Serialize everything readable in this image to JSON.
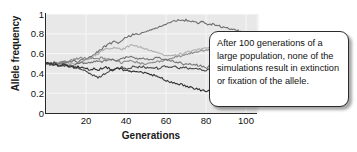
{
  "chart_data": {
    "type": "line",
    "title": "",
    "xlabel": "Generations",
    "ylabel": "Allele frequency",
    "xlim": [
      0,
      105
    ],
    "ylim": [
      0,
      1
    ],
    "grid": true,
    "legend": "none",
    "xticks": [
      "20",
      "40",
      "60",
      "80",
      "100"
    ],
    "xtick_values": [
      20,
      40,
      60,
      80,
      100
    ],
    "yticks": [
      "0",
      "0.2",
      "0.4",
      "0.6",
      "0.8",
      "1"
    ],
    "ytick_values": [
      0,
      0.2,
      0.4,
      0.6,
      0.8,
      1
    ],
    "annotation": "After 100 generations of a large population, none of the simulations result in extinction or fixation of the allele.",
    "start_frequency": 0.5,
    "series": [
      {
        "name": "simulation-1",
        "color": "#6e6e6e",
        "x": [
          0,
          2,
          4,
          6,
          8,
          10,
          12,
          14,
          16,
          18,
          20,
          22,
          24,
          26,
          28,
          30,
          32,
          34,
          36,
          38,
          40,
          42,
          44,
          46,
          48,
          50,
          52,
          54,
          56,
          58,
          60,
          62,
          64,
          66,
          68,
          70,
          72,
          74,
          76,
          78,
          80,
          82,
          84,
          86,
          88,
          90,
          92,
          94,
          96,
          98,
          100
        ],
        "values": [
          0.5,
          0.5,
          0.51,
          0.5,
          0.52,
          0.51,
          0.52,
          0.53,
          0.52,
          0.54,
          0.55,
          0.57,
          0.59,
          0.62,
          0.65,
          0.68,
          0.7,
          0.72,
          0.71,
          0.74,
          0.77,
          0.78,
          0.8,
          0.79,
          0.81,
          0.82,
          0.84,
          0.85,
          0.87,
          0.88,
          0.9,
          0.92,
          0.93,
          0.94,
          0.93,
          0.94,
          0.92,
          0.93,
          0.91,
          0.92,
          0.9,
          0.89,
          0.9,
          0.88,
          0.87,
          0.86,
          0.85,
          0.84,
          0.83,
          0.82,
          0.82
        ]
      },
      {
        "name": "simulation-2",
        "color": "#b0b0b0",
        "x": [
          0,
          2,
          4,
          6,
          8,
          10,
          12,
          14,
          16,
          18,
          20,
          22,
          24,
          26,
          28,
          30,
          32,
          34,
          36,
          38,
          40,
          42,
          44,
          46,
          48,
          50,
          52,
          54,
          56,
          58,
          60,
          62,
          64,
          66,
          68,
          70,
          72,
          74,
          76,
          78,
          80,
          82,
          84,
          86,
          88,
          90,
          92,
          94,
          96,
          98,
          100
        ],
        "values": [
          0.5,
          0.49,
          0.5,
          0.49,
          0.48,
          0.49,
          0.5,
          0.49,
          0.5,
          0.52,
          0.53,
          0.55,
          0.58,
          0.6,
          0.63,
          0.65,
          0.64,
          0.66,
          0.65,
          0.64,
          0.66,
          0.68,
          0.69,
          0.67,
          0.66,
          0.65,
          0.63,
          0.62,
          0.6,
          0.59,
          0.58,
          0.57,
          0.58,
          0.59,
          0.6,
          0.61,
          0.62,
          0.63,
          0.64,
          0.65,
          0.66,
          0.65,
          0.66,
          0.67,
          0.68,
          0.69,
          0.7,
          0.69,
          0.68,
          0.67,
          0.66
        ]
      },
      {
        "name": "simulation-3",
        "color": "#8a8a8a",
        "x": [
          0,
          2,
          4,
          6,
          8,
          10,
          12,
          14,
          16,
          18,
          20,
          22,
          24,
          26,
          28,
          30,
          32,
          34,
          36,
          38,
          40,
          42,
          44,
          46,
          48,
          50,
          52,
          54,
          56,
          58,
          60,
          62,
          64,
          66,
          68,
          70,
          72,
          74,
          76,
          78,
          80,
          82,
          84,
          86,
          88,
          90,
          92,
          94,
          96,
          98,
          100
        ],
        "values": [
          0.5,
          0.5,
          0.49,
          0.5,
          0.51,
          0.52,
          0.53,
          0.54,
          0.55,
          0.56,
          0.55,
          0.56,
          0.55,
          0.54,
          0.56,
          0.55,
          0.54,
          0.53,
          0.52,
          0.51,
          0.52,
          0.53,
          0.52,
          0.51,
          0.5,
          0.49,
          0.5,
          0.51,
          0.52,
          0.53,
          0.54,
          0.55,
          0.56,
          0.57,
          0.58,
          0.59,
          0.6,
          0.61,
          0.62,
          0.63,
          0.64,
          0.63,
          0.64,
          0.65,
          0.66,
          0.67,
          0.68,
          0.69,
          0.7,
          0.71,
          0.72
        ]
      },
      {
        "name": "simulation-4",
        "color": "#757575",
        "x": [
          0,
          2,
          4,
          6,
          8,
          10,
          12,
          14,
          16,
          18,
          20,
          22,
          24,
          26,
          28,
          30,
          32,
          34,
          36,
          38,
          40,
          42,
          44,
          46,
          48,
          50,
          52,
          54,
          56,
          58,
          60,
          62,
          64,
          66,
          68,
          70,
          72,
          74,
          76,
          78,
          80,
          82,
          84,
          86,
          88,
          90,
          92,
          94,
          96,
          98,
          100
        ],
        "values": [
          0.5,
          0.5,
          0.5,
          0.49,
          0.5,
          0.49,
          0.48,
          0.49,
          0.5,
          0.51,
          0.5,
          0.51,
          0.52,
          0.53,
          0.52,
          0.53,
          0.54,
          0.53,
          0.54,
          0.55,
          0.56,
          0.57,
          0.56,
          0.55,
          0.56,
          0.55,
          0.54,
          0.55,
          0.56,
          0.55,
          0.54,
          0.53,
          0.52,
          0.51,
          0.5,
          0.49,
          0.5,
          0.49,
          0.48,
          0.47,
          0.46,
          0.47,
          0.46,
          0.45,
          0.46,
          0.45,
          0.44,
          0.45,
          0.44,
          0.45,
          0.44
        ]
      },
      {
        "name": "simulation-5",
        "color": "#4a4a4a",
        "x": [
          0,
          2,
          4,
          6,
          8,
          10,
          12,
          14,
          16,
          18,
          20,
          22,
          24,
          26,
          28,
          30,
          32,
          34,
          36,
          38,
          40,
          42,
          44,
          46,
          48,
          50,
          52,
          54,
          56,
          58,
          60,
          62,
          64,
          66,
          68,
          70,
          72,
          74,
          76,
          78,
          80,
          82,
          84,
          86,
          88,
          90,
          92,
          94,
          96,
          98,
          100
        ],
        "values": [
          0.5,
          0.49,
          0.5,
          0.48,
          0.47,
          0.48,
          0.47,
          0.46,
          0.45,
          0.44,
          0.42,
          0.4,
          0.38,
          0.35,
          0.38,
          0.41,
          0.42,
          0.44,
          0.45,
          0.46,
          0.45,
          0.46,
          0.47,
          0.46,
          0.47,
          0.46,
          0.45,
          0.46,
          0.45,
          0.46,
          0.47,
          0.46,
          0.47,
          0.46,
          0.45,
          0.46,
          0.45,
          0.44,
          0.45,
          0.44,
          0.43,
          0.44,
          0.45,
          0.44,
          0.45,
          0.44,
          0.45,
          0.44,
          0.43,
          0.44,
          0.43
        ]
      },
      {
        "name": "simulation-6",
        "color": "#303030",
        "x": [
          0,
          2,
          4,
          6,
          8,
          10,
          12,
          14,
          16,
          18,
          20,
          22,
          24,
          26,
          28,
          30,
          32,
          34,
          36,
          38,
          40,
          42,
          44,
          46,
          48,
          50,
          52,
          54,
          56,
          58,
          60,
          62,
          64,
          66,
          68,
          70,
          72,
          74,
          76,
          78,
          80,
          82,
          84,
          86,
          88,
          90,
          92,
          94,
          96,
          98,
          100
        ],
        "values": [
          0.5,
          0.5,
          0.49,
          0.48,
          0.49,
          0.48,
          0.47,
          0.46,
          0.47,
          0.46,
          0.45,
          0.44,
          0.45,
          0.44,
          0.45,
          0.46,
          0.45,
          0.44,
          0.45,
          0.44,
          0.43,
          0.42,
          0.43,
          0.42,
          0.41,
          0.4,
          0.39,
          0.38,
          0.37,
          0.35,
          0.33,
          0.31,
          0.3,
          0.28,
          0.29,
          0.27,
          0.26,
          0.25,
          0.24,
          0.23,
          0.22,
          0.23,
          0.22,
          0.21,
          0.22,
          0.21,
          0.22,
          0.21,
          0.22,
          0.21,
          0.22
        ]
      }
    ]
  }
}
